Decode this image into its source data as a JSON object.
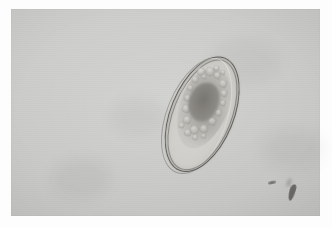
{
  "image": {
    "kind": "micrograph",
    "modality": "brightfield-light-microscopy",
    "width": 332,
    "height": 228,
    "caption": "",
    "border": {
      "style": "white-margin-frame",
      "color": "#fdfdfd",
      "left": 11,
      "top": 9,
      "right": 12,
      "bottom": 12
    },
    "field": {
      "label": "microscope-field",
      "background_color": "#c9c9c7",
      "tone": "uniform light gray",
      "x": 11,
      "y": 9,
      "width": 309,
      "height": 207
    }
  },
  "specimen": {
    "label": "parasite-egg",
    "common_name": "helminth ovum",
    "shape": "elongated ellipse (ovoid)",
    "orientation_degrees": 22,
    "bounding_box": {
      "x": 167,
      "y": 50,
      "width": 68,
      "height": 124
    },
    "shell": {
      "label": "egg-shell",
      "appearance": "thin smooth double-contoured wall",
      "outline_color": "#46443f",
      "interior_color": "#cbcac5"
    },
    "contents": {
      "label": "embryo-mass",
      "appearance": "granular blastomeres / yolk cells",
      "core_label": "dense-central-mass",
      "core_color": "#6c6a65"
    }
  },
  "artifacts": [
    {
      "label": "debris-speck-small",
      "x": 268,
      "y": 181,
      "width": 8,
      "height": 3,
      "color": "#3e3c39"
    },
    {
      "label": "debris-speck-large",
      "x": 289,
      "y": 184,
      "width": 6,
      "height": 17,
      "color": "#3e3c39"
    }
  ],
  "granules": [
    {
      "x": 30,
      "y": 30,
      "d": 8
    },
    {
      "x": 38,
      "y": 26,
      "d": 9
    },
    {
      "x": 47,
      "y": 28,
      "d": 7
    },
    {
      "x": 55,
      "y": 33,
      "d": 8
    },
    {
      "x": 28,
      "y": 40,
      "d": 7
    },
    {
      "x": 60,
      "y": 42,
      "d": 7
    },
    {
      "x": 27,
      "y": 50,
      "d": 6
    },
    {
      "x": 63,
      "y": 52,
      "d": 6
    },
    {
      "x": 28,
      "y": 60,
      "d": 7
    },
    {
      "x": 62,
      "y": 62,
      "d": 7
    },
    {
      "x": 30,
      "y": 70,
      "d": 8
    },
    {
      "x": 59,
      "y": 72,
      "d": 8
    },
    {
      "x": 35,
      "y": 80,
      "d": 8
    },
    {
      "x": 45,
      "y": 86,
      "d": 9
    },
    {
      "x": 54,
      "y": 82,
      "d": 8
    },
    {
      "x": 41,
      "y": 92,
      "d": 7
    },
    {
      "x": 50,
      "y": 94,
      "d": 6
    },
    {
      "x": 33,
      "y": 88,
      "d": 6
    },
    {
      "x": 44,
      "y": 22,
      "d": 6
    },
    {
      "x": 52,
      "y": 24,
      "d": 5
    },
    {
      "x": 36,
      "y": 35,
      "d": 5
    },
    {
      "x": 58,
      "y": 90,
      "d": 5
    }
  ],
  "blotches": [
    {
      "x": 40,
      "y": 150,
      "w": 60,
      "h": 40,
      "o": 0.04
    },
    {
      "x": 200,
      "y": 30,
      "w": 70,
      "h": 45,
      "o": 0.03
    },
    {
      "x": 100,
      "y": 90,
      "w": 55,
      "h": 35,
      "o": 0.03
    },
    {
      "x": 250,
      "y": 120,
      "w": 65,
      "h": 40,
      "o": 0.035
    }
  ]
}
